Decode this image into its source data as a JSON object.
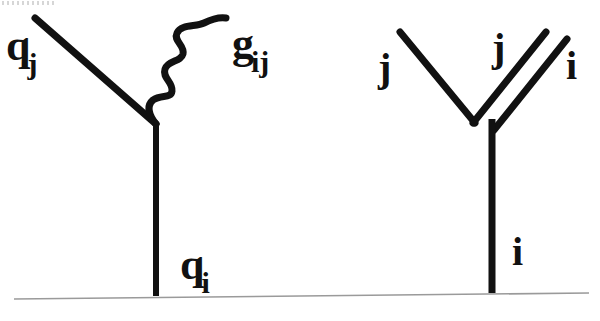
{
  "figure": {
    "background_color": "#ffffff",
    "ink_color": "#111111",
    "baseline_color": "#9a9a9a"
  },
  "left_diagram": {
    "name": "quark-gluon-vertex",
    "labels": {
      "incoming_quark": {
        "base": "q",
        "sub": "j"
      },
      "gluon": {
        "base": "g",
        "sub": "ij"
      },
      "outgoing_quark": {
        "base": "q",
        "sub": "i"
      }
    },
    "lines": [
      {
        "name": "incoming-quark-line",
        "type": "straight",
        "from": [
          35,
          18
        ],
        "to": [
          156,
          124
        ]
      },
      {
        "name": "gluon-wavy-line",
        "type": "wavy",
        "from": [
          156,
          124
        ],
        "to": [
          226,
          18
        ]
      },
      {
        "name": "outgoing-quark-line",
        "type": "straight",
        "from": [
          156,
          124
        ],
        "to": [
          156,
          296
        ]
      }
    ]
  },
  "right_diagram": {
    "name": "double-index-line-vertex",
    "labels": {
      "left_arm": "j",
      "middle": "j",
      "right_arm": "i",
      "bottom": "i"
    },
    "lines": [
      {
        "name": "left-arm-line",
        "type": "straight",
        "from": [
          400,
          32
        ],
        "to": [
          474,
          122
        ]
      },
      {
        "name": "right-arm-inner-line",
        "type": "straight",
        "from": [
          474,
          122
        ],
        "to": [
          545,
          33
        ]
      },
      {
        "name": "right-arm-outer-line",
        "type": "straight",
        "from": [
          494,
          128
        ],
        "to": [
          566,
          40
        ]
      },
      {
        "name": "bottom-vertical-line",
        "type": "straight",
        "from": [
          492,
          120
        ],
        "to": [
          492,
          293
        ]
      }
    ]
  },
  "baseline": {
    "name": "page-rule",
    "from": [
      14,
      299
    ],
    "to": [
      589,
      293
    ]
  }
}
